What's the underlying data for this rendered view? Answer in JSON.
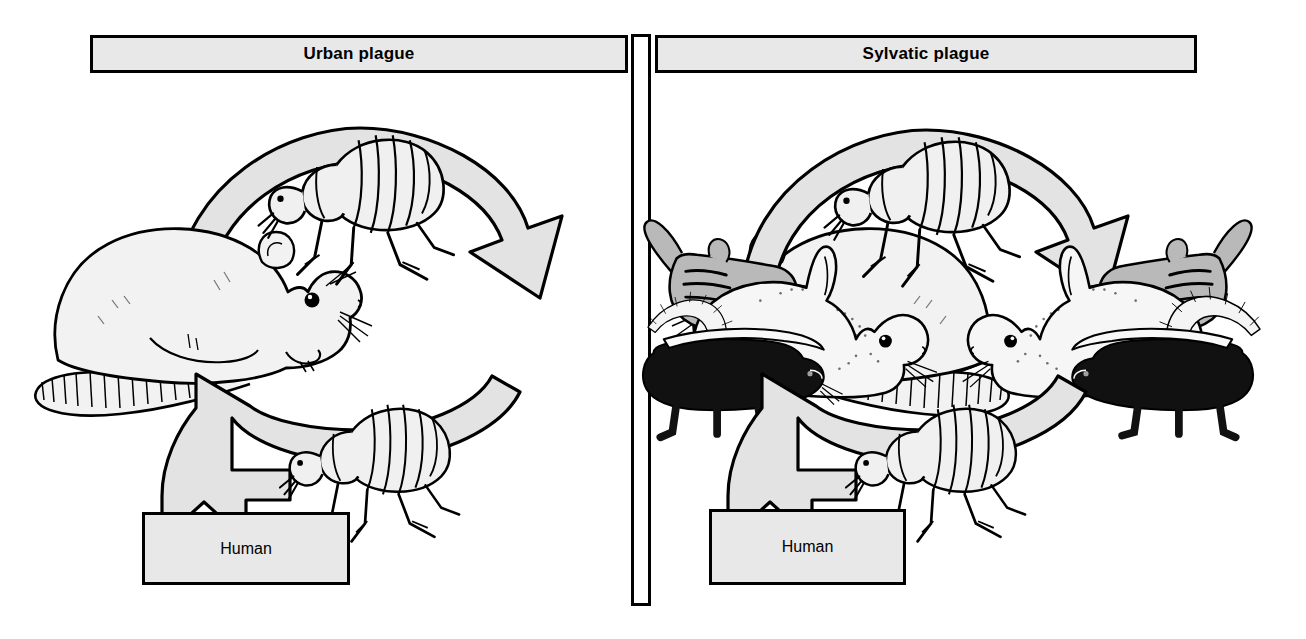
{
  "diagram": {
    "kind": "plague-transmission-cycle-diagram",
    "panels": [
      {
        "id": "urban",
        "title": "Urban plague",
        "terminal_label": "Human",
        "animals": [
          "rat",
          "rat"
        ],
        "vectors": [
          "flea",
          "flea"
        ]
      },
      {
        "id": "sylvatic",
        "title": "Sylvatic plague",
        "terminal_label": "Human",
        "animals": [
          "chipmunk",
          "rabbit",
          "skunk",
          "rabbit",
          "chipmunk",
          "skunk"
        ],
        "vectors": [
          "flea",
          "flea"
        ]
      }
    ]
  },
  "panel_urban": {
    "title": "Urban plague",
    "human": "Human"
  },
  "panel_sylvatic": {
    "title": "Sylvatic plague",
    "human": "Human"
  },
  "colors": {
    "box_fill": "#e8e8e8",
    "arrow_fill": "#e3e3e3",
    "outline": "#000000",
    "animal_light": "#f2f2f2",
    "animal_gray": "#b9b9b9",
    "animal_dark": "#111111",
    "page_background": "#ffffff"
  },
  "icons": {
    "flea": "flea-icon",
    "rat": "rat-icon",
    "rabbit": "rabbit-icon",
    "chipmunk": "chipmunk-icon",
    "skunk": "skunk-icon",
    "arrow": "curved-arrow-icon",
    "divider": "vertical-divider-icon"
  }
}
